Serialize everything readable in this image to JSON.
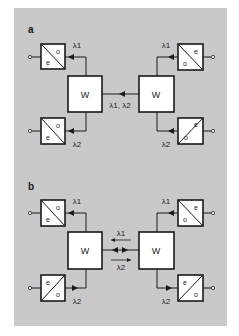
{
  "figure": {
    "background_color": "#c9c9c9",
    "line_color": "#1a1a1a",
    "panels": [
      {
        "label": "a",
        "wdm_label_left": "W",
        "wdm_label_right": "W",
        "link_label": "λ1, λ2",
        "link_arrow": "left",
        "converters": {
          "top_left": {
            "e": "e",
            "o": "o",
            "wavelength": "λ1",
            "arrow": "left"
          },
          "bottom_left": {
            "e": "e",
            "o": "o",
            "wavelength": "λ2",
            "arrow": "left"
          },
          "top_right": {
            "e": "e",
            "o": "o",
            "wavelength": "λ1",
            "arrow": "left"
          },
          "bottom_right": {
            "e": "e",
            "o": "o",
            "wavelength": "λ2",
            "arrow": "left"
          }
        }
      },
      {
        "label": "b",
        "wdm_label_left": "W",
        "wdm_label_right": "W",
        "link_label_top": "λ1",
        "link_label_bottom": "λ2",
        "link_arrow": "bidirectional",
        "converters": {
          "top_left": {
            "e": "e",
            "o": "o",
            "wavelength": "λ1",
            "arrow": "left"
          },
          "bottom_left": {
            "e": "e",
            "o": "o",
            "wavelength": "λ2",
            "arrow": "right"
          },
          "top_right": {
            "e": "e",
            "o": "o",
            "wavelength": "λ1",
            "arrow": "left"
          },
          "bottom_right": {
            "e": "e",
            "o": "o",
            "wavelength": "λ2",
            "arrow": "right"
          }
        }
      }
    ]
  }
}
